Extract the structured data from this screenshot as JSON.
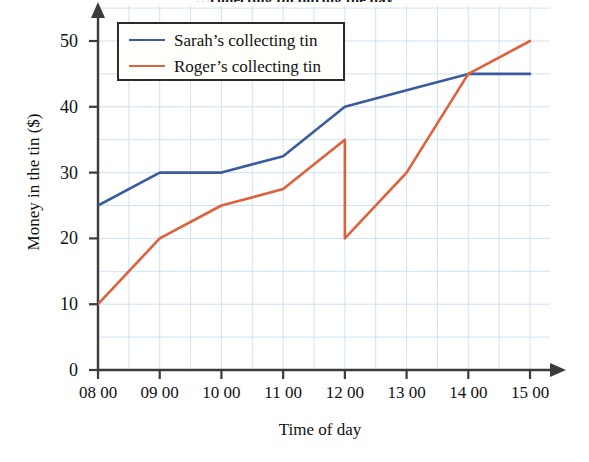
{
  "title": "…collecting tin during the day",
  "axes": {
    "y_title": "Money in the tin ($)",
    "x_title": "Time of day",
    "y_ticks": [
      "0",
      "10",
      "20",
      "30",
      "40",
      "50"
    ],
    "x_ticks": [
      "08 00",
      "09 00",
      "10 00",
      "11 00",
      "12 00",
      "13 00",
      "14 00",
      "15 00"
    ]
  },
  "legend": {
    "items": [
      {
        "label": "Sarah’s collecting tin",
        "color": "#3a5ba0"
      },
      {
        "label": "Roger’s collecting tin",
        "color": "#e0603a"
      }
    ]
  },
  "colors": {
    "sarah": "#3a5ba0",
    "roger": "#e0603a",
    "grid": "#cfe2f3",
    "axis": "#3b3b3b",
    "background": "#ffffff"
  },
  "chart_data": {
    "type": "line",
    "title": "…collecting tin during the day",
    "xlabel": "Time of day",
    "ylabel": "Money in the tin ($)",
    "x": [
      "08 00",
      "09 00",
      "10 00",
      "11 00",
      "12 00",
      "13 00",
      "14 00",
      "15 00"
    ],
    "xlim": [
      8,
      15.3
    ],
    "ylim": [
      0,
      53
    ],
    "yticks": [
      0,
      10,
      20,
      30,
      40,
      50
    ],
    "grid": true,
    "legend_position": "top-left inside plot",
    "series": [
      {
        "name": "Sarah’s collecting tin",
        "color": "#3a5ba0",
        "values": [
          25,
          30,
          30,
          32.5,
          40,
          42.5,
          45,
          45
        ]
      },
      {
        "name": "Roger’s collecting tin",
        "color": "#e0603a",
        "values": [
          10,
          20,
          25,
          27.5,
          35,
          30,
          45,
          50
        ],
        "annotations": [
          {
            "type": "vertical-drop",
            "at": "12 00",
            "from": 35,
            "to": 20,
            "note": "tin emptied at 12 00: value falls from 35 to 20"
          }
        ],
        "points_after_drop": [
          {
            "x": "12 00",
            "y": 20
          },
          {
            "x": "13 00",
            "y": 30
          },
          {
            "x": "14 00",
            "y": 45
          },
          {
            "x": "15 00",
            "y": 50
          }
        ]
      }
    ]
  }
}
